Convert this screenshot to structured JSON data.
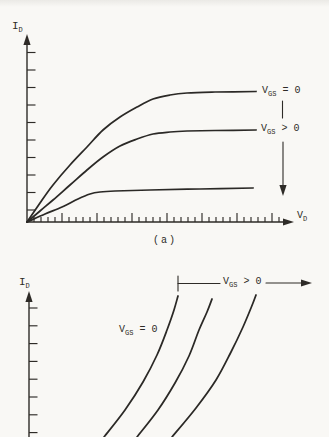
{
  "figure": {
    "paper_color": "#f9f8f5",
    "ink_color": "#2e2b27",
    "caption_a": "(a)"
  },
  "panel_a": {
    "y_axis_label": {
      "pre": "I",
      "sub": "D"
    },
    "x_axis_label": {
      "pre": "V",
      "sub": "D"
    },
    "label_vgs_equals_zero": {
      "pre": "V",
      "sub": "GS",
      "post": " = 0"
    },
    "label_vgs_greater_zero": {
      "pre": "V",
      "sub": "GS",
      "post": " > 0"
    }
  },
  "panel_b": {
    "y_axis_label": {
      "pre": "I",
      "sub": "D"
    },
    "label_vgs_equals_zero": {
      "pre": "V",
      "sub": "GS",
      "post": " = 0"
    },
    "label_vgs_greater_zero": {
      "pre": "V",
      "sub": "GS",
      "post": " > 0"
    }
  },
  "chart_data": [
    {
      "id": "panel-a-output-characteristics",
      "type": "line",
      "title": "",
      "xlabel": "V_D",
      "ylabel": "I_D",
      "caption": "(a)",
      "axes_numeric": false,
      "grid": false,
      "description": "Qualitative drain characteristics: I_D vs V_D curves rise from the origin and saturate; a downward arrow beside the labels indicates increasing V_GS.",
      "annotations": [
        {
          "text": "V_GS = 0",
          "attached_to": "top curve"
        },
        {
          "text": "V_GS > 0",
          "attached_to": "middle curve"
        },
        {
          "text": "downward arrow marking direction of increasing V_GS"
        }
      ],
      "series": [
        {
          "name": "V_GS = 0",
          "points_px": [
            [
              27,
              222
            ],
            [
              40,
              203
            ],
            [
              53,
              185
            ],
            [
              70,
              165
            ],
            [
              87,
              147
            ],
            [
              103,
              130
            ],
            [
              120,
              117
            ],
            [
              137,
              107
            ],
            [
              153,
              99
            ],
            [
              170,
              95
            ],
            [
              187,
              93
            ],
            [
              215,
              92
            ],
            [
              256,
              91.5
            ]
          ]
        },
        {
          "name": "V_GS > 0",
          "points_px": [
            [
              27,
              222
            ],
            [
              40,
              211
            ],
            [
              53,
              200
            ],
            [
              70,
              185
            ],
            [
              87,
              170
            ],
            [
              103,
              157
            ],
            [
              120,
              146
            ],
            [
              137,
              139
            ],
            [
              153,
              134
            ],
            [
              170,
              132
            ],
            [
              187,
              131
            ],
            [
              215,
              130.5
            ],
            [
              256,
              130
            ]
          ]
        },
        {
          "name": "V_GS more positive (unlabeled)",
          "points_px": [
            [
              27,
              222
            ],
            [
              45,
              214
            ],
            [
              62,
              207
            ],
            [
              78,
              199
            ],
            [
              90,
              194
            ],
            [
              100,
              192
            ],
            [
              115,
              191
            ],
            [
              150,
              190
            ],
            [
              200,
              189
            ],
            [
              253,
              188
            ]
          ]
        }
      ]
    },
    {
      "id": "panel-b-steep-characteristics",
      "type": "line",
      "title": "",
      "xlabel": "",
      "ylabel": "I_D",
      "axes_numeric": false,
      "grid": false,
      "description": "Qualitative steeply rising I_D curves (lower panel, cut off at image bottom); leftmost curve labeled V_GS = 0, horizontal arrow at top labeled V_GS > 0 pointing right.",
      "annotations": [
        {
          "text": "V_GS = 0",
          "attached_to": "leftmost curve"
        },
        {
          "text": "V_GS > 0",
          "attached_to": "right-pointing range arrow at top"
        }
      ],
      "series": [
        {
          "name": "V_GS = 0",
          "points_px": [
            [
              104,
              437
            ],
            [
              125,
              410
            ],
            [
              143,
              382
            ],
            [
              157,
              355
            ],
            [
              167,
              330
            ],
            [
              174,
              310
            ],
            [
              178,
              296
            ]
          ]
        },
        {
          "name": "V_GS > 0 (first)",
          "points_px": [
            [
              137,
              437
            ],
            [
              158,
              410
            ],
            [
              175,
              383
            ],
            [
              189,
              356
            ],
            [
              199,
              330
            ],
            [
              207,
              312
            ],
            [
              212,
              299
            ]
          ]
        },
        {
          "name": "V_GS > 0 (second)",
          "points_px": [
            [
              172,
              437
            ],
            [
              196,
              408
            ],
            [
              216,
              380
            ],
            [
              231,
              352
            ],
            [
              243,
              327
            ],
            [
              251,
              308
            ],
            [
              256,
              295
            ]
          ]
        }
      ]
    }
  ]
}
